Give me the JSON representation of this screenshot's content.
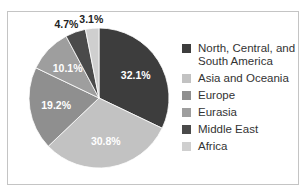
{
  "chart_data": {
    "type": "pie",
    "title": "",
    "legend_position": "right",
    "slices": [
      {
        "label": "North, Central, and South America",
        "value": 32.1,
        "display": "32.1%",
        "color": "#3d3d3d"
      },
      {
        "label": "Asia and Oceania",
        "value": 30.8,
        "display": "30.8%",
        "color": "#c2c2c2"
      },
      {
        "label": "Europe",
        "value": 19.2,
        "display": "19.2%",
        "color": "#8f8f8f"
      },
      {
        "label": "Eurasia",
        "value": 10.1,
        "display": "10.1%",
        "color": "#9e9e9e"
      },
      {
        "label": "Middle East",
        "value": 4.7,
        "display": "4.7%",
        "color": "#4a4a4a"
      },
      {
        "label": "Africa",
        "value": 3.1,
        "display": "3.1%",
        "color": "#cfcfcf"
      }
    ]
  }
}
